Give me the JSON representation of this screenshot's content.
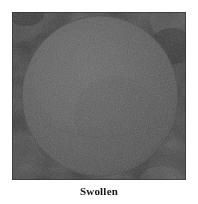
{
  "figure": {
    "caption": "Swollen",
    "media_type": "grayscale-photograph",
    "subject_shape": "circle",
    "colors": {
      "page_background": "#ffffff",
      "photo_background": "#3b3b3b",
      "photo_corner_mottle_light": "#5e5e5e",
      "photo_corner_mottle_dark": "#242424",
      "circle_fill": "#585858",
      "circle_highlight": "#646464",
      "circle_edge": "#4a4a4a",
      "caption_text": "#161616"
    },
    "photo": {
      "x": 12,
      "y": 12,
      "width": 174,
      "height": 168
    },
    "circle": {
      "center_x": 88,
      "center_y": 84,
      "radius_x": 78,
      "radius_y": 80
    }
  }
}
